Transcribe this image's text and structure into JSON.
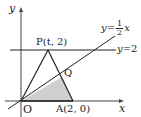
{
  "diagram": {
    "axes": {
      "x_label": "x",
      "y_label": "y",
      "origin_label": "O"
    },
    "points": {
      "P": "P(t, 2)",
      "A": "A(2, 0)",
      "Q": "Q"
    },
    "lines": {
      "horizontal": {
        "label_lhs": "y",
        "label_eq": "=",
        "label_rhs": "2"
      },
      "diagonal": {
        "label_lhs": "y",
        "label_eq": "=",
        "num": "1",
        "den": "2",
        "var": "x"
      }
    },
    "colors": {
      "line": "#222222",
      "axis": "#444444",
      "shade": "#cfcfcf"
    },
    "shaded_region": "triangle OQA"
  }
}
